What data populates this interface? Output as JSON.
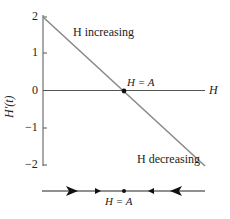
{
  "diagram": {
    "type": "phase-line-diagram",
    "y_axis": {
      "label": "H'(t)",
      "ticks": [
        "2",
        "1",
        "0",
        "−1",
        "−2"
      ]
    },
    "x_axis": {
      "label": "H"
    },
    "annotations": {
      "increasing": "H increasing",
      "decreasing": "H decreasing",
      "equilibrium": "H = A",
      "phase_equilibrium": "H = A"
    },
    "colors": {
      "line": "#8a8a8a",
      "axis": "#555555",
      "text": "#222222",
      "point": "#111111"
    }
  }
}
